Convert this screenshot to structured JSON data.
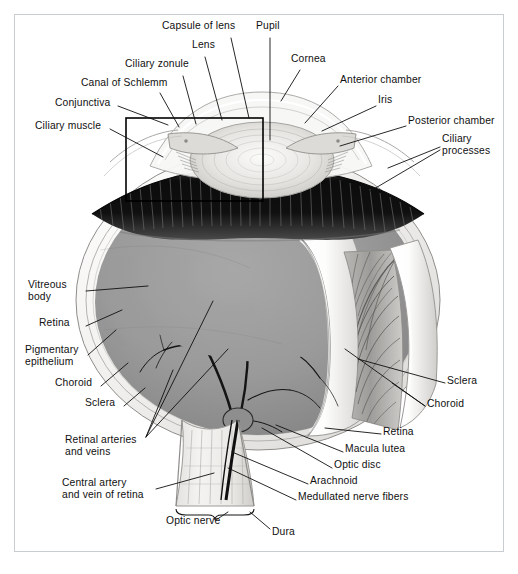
{
  "figure": {
    "type": "anatomical-illustration",
    "style": "grayscale halftone medical illustration",
    "border_color": "#c9cdd2",
    "background_color": "#ffffff",
    "ink_color": "#101010",
    "fundus_gray": "#9a9a9a",
    "ciliary_body_dark": "#161616",
    "sclera_white": "#f2f2f0"
  },
  "inset_box": {
    "name": "ciliary-region-detail-box",
    "x": 126,
    "y": 118,
    "width": 137,
    "height": 83,
    "stroke": "#000000",
    "stroke_width": 1.6
  },
  "labels": [
    {
      "id": "capsule-of-lens",
      "text": "Capsule of lens",
      "x": 162,
      "y": 26,
      "align": "left"
    },
    {
      "id": "pupil",
      "text": "Pupil",
      "x": 256,
      "y": 26,
      "align": "left"
    },
    {
      "id": "lens",
      "text": "Lens",
      "x": 192,
      "y": 45,
      "align": "left"
    },
    {
      "id": "cornea",
      "text": "Cornea",
      "x": 291,
      "y": 59,
      "align": "left"
    },
    {
      "id": "ciliary-zonule",
      "text": "Ciliary zonule",
      "x": 125,
      "y": 64,
      "align": "left"
    },
    {
      "id": "anterior-chamber",
      "text": "Anterior chamber",
      "x": 340,
      "y": 80,
      "align": "left"
    },
    {
      "id": "canal-of-schlemm",
      "text": "Canal of Schlemm",
      "x": 81,
      "y": 83,
      "align": "left"
    },
    {
      "id": "iris",
      "text": "Iris",
      "x": 378,
      "y": 100,
      "align": "left"
    },
    {
      "id": "conjunctiva",
      "text": "Conjunctiva",
      "x": 55,
      "y": 103,
      "align": "left"
    },
    {
      "id": "posterior-chamber",
      "text": "Posterior chamber",
      "x": 408,
      "y": 121,
      "align": "left"
    },
    {
      "id": "ciliary-muscle",
      "text": "Ciliary muscle",
      "x": 35,
      "y": 126,
      "align": "left"
    },
    {
      "id": "ciliary-processes",
      "text": "Ciliary\nprocesses",
      "x": 442,
      "y": 139,
      "align": "left"
    },
    {
      "id": "vitreous-body",
      "text": "Vitreous\nbody",
      "x": 28,
      "y": 285,
      "align": "left"
    },
    {
      "id": "retina-left",
      "text": "Retina",
      "x": 39,
      "y": 323,
      "align": "left"
    },
    {
      "id": "pigmentary-epithelium",
      "text": "Pigmentary\nepithelium",
      "x": 25,
      "y": 350,
      "align": "left"
    },
    {
      "id": "choroid-left",
      "text": "Choroid",
      "x": 55,
      "y": 383,
      "align": "left"
    },
    {
      "id": "sclera-left",
      "text": "Sclera",
      "x": 85,
      "y": 403,
      "align": "left"
    },
    {
      "id": "sclera-right",
      "text": "Sclera",
      "x": 447,
      "y": 381,
      "align": "left"
    },
    {
      "id": "choroid-right",
      "text": "Choroid",
      "x": 427,
      "y": 404,
      "align": "left"
    },
    {
      "id": "retinal-arteries-veins",
      "text": "Retinal arteries\nand veins",
      "x": 65,
      "y": 440,
      "align": "left"
    },
    {
      "id": "retina-right",
      "text": "Retina",
      "x": 383,
      "y": 432,
      "align": "left"
    },
    {
      "id": "macula-lutea",
      "text": "Macula lutea",
      "x": 345,
      "y": 449,
      "align": "left"
    },
    {
      "id": "optic-disc",
      "text": "Optic disc",
      "x": 334,
      "y": 465,
      "align": "left"
    },
    {
      "id": "central-artery-vein",
      "text": "Central artery\nand vein of retina",
      "x": 62,
      "y": 483,
      "align": "left"
    },
    {
      "id": "arachnoid",
      "text": "Arachnoid",
      "x": 310,
      "y": 481,
      "align": "left"
    },
    {
      "id": "medullated-nerve-fibers",
      "text": "Medullated nerve fibers",
      "x": 298,
      "y": 497,
      "align": "left"
    },
    {
      "id": "optic-nerve",
      "text": "Optic nerve",
      "x": 166,
      "y": 521,
      "align": "left"
    },
    {
      "id": "dura",
      "text": "Dura",
      "x": 272,
      "y": 532,
      "align": "left"
    }
  ],
  "leaders": [
    {
      "id": "leader-capsule-of-lens",
      "points": "231,38 249,118"
    },
    {
      "id": "leader-pupil",
      "points": "270,38 270,140"
    },
    {
      "id": "leader-lens",
      "points": "205,57 222,120"
    },
    {
      "id": "leader-cornea",
      "points": "300,70 281,101"
    },
    {
      "id": "leader-ciliary-zonule",
      "points": "183,76 196,124"
    },
    {
      "id": "leader-anterior-chamber",
      "points": "338,86 305,123"
    },
    {
      "id": "leader-canal-of-schlemm",
      "points": "160,93 179,127"
    },
    {
      "id": "leader-iris",
      "points": "376,106 322,131"
    },
    {
      "id": "leader-conjunctiva",
      "points": "118,106 168,125"
    },
    {
      "id": "leader-posterior-chamber",
      "points": "406,126 340,146"
    },
    {
      "id": "leader-ciliary-muscle",
      "points": "110,129 163,157"
    },
    {
      "id": "leader-ciliary-processes-a",
      "points": "440,147 388,168"
    },
    {
      "id": "leader-ciliary-processes-b",
      "points": "440,150 362,196"
    },
    {
      "id": "leader-vitreous-body",
      "points": "86,291 148,286"
    },
    {
      "id": "leader-retina-left",
      "points": "86,326 122,310"
    },
    {
      "id": "leader-pigmentary-epithelium",
      "points": "88,355 116,330"
    },
    {
      "id": "leader-choroid-left",
      "points": "101,386 128,363"
    },
    {
      "id": "leader-sclera-left",
      "points": "124,406 145,388"
    },
    {
      "id": "leader-sclera-right",
      "points": "445,383 358,359"
    },
    {
      "id": "leader-choroid-right-a",
      "points": "425,406 392,383"
    },
    {
      "id": "leader-choroid-right-b",
      "points": "425,406 345,349"
    },
    {
      "id": "leader-retinal-a",
      "points": "146,437 228,349"
    },
    {
      "id": "leader-retinal-b",
      "points": "146,437 213,301"
    },
    {
      "id": "leader-retinal-c",
      "points": "146,437 173,370"
    },
    {
      "id": "leader-retina-right",
      "points": "381,434 325,428"
    },
    {
      "id": "leader-macula-lutea",
      "points": "343,452 276,425"
    },
    {
      "id": "leader-optic-disc",
      "points": "332,468 262,428"
    },
    {
      "id": "leader-arachnoid",
      "points": "308,484 232,452"
    },
    {
      "id": "leader-medullated",
      "points": "296,500 228,468"
    },
    {
      "id": "leader-central-artery",
      "points": "156,489 214,473"
    },
    {
      "id": "leader-optic-nerve",
      "points": "216,520 228,505"
    },
    {
      "id": "leader-dura",
      "points": "270,529 250,512"
    }
  ],
  "brace_optic_nerve": {
    "x1": 176,
    "x2": 254,
    "y": 505
  },
  "structures": [
    {
      "id": "sclera-shell",
      "label": "Sclera"
    },
    {
      "id": "choroid-layer",
      "label": "Choroid"
    },
    {
      "id": "retina-layer",
      "label": "Retina"
    },
    {
      "id": "fundus",
      "label": "Vitreous body"
    },
    {
      "id": "ciliary-body",
      "label": "Ciliary body"
    },
    {
      "id": "lens-body",
      "label": "Lens"
    },
    {
      "id": "cornea-dome",
      "label": "Cornea"
    },
    {
      "id": "iris-left",
      "label": "Iris (left)"
    },
    {
      "id": "iris-right",
      "label": "Iris (right)"
    },
    {
      "id": "optic-nerve-stalk",
      "label": "Optic nerve"
    },
    {
      "id": "vessel-tree",
      "label": "Retinal arteries and veins"
    },
    {
      "id": "cutaway-flaps",
      "label": "Cut-away layers"
    }
  ]
}
